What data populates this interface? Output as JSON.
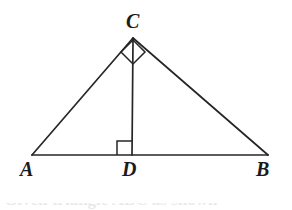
{
  "figure": {
    "background_color": "#ffffff",
    "stroke_color": "#262626",
    "label_color": "#1b1b1b",
    "stroke_width": 1.6,
    "width": 292,
    "height": 210
  },
  "labels": {
    "apex": "C",
    "left_base": "A",
    "foot": "D",
    "right_base": "B"
  },
  "points": {
    "A": {
      "x": 32,
      "y": 155
    },
    "B": {
      "x": 268,
      "y": 155
    },
    "C": {
      "x": 133,
      "y": 38
    },
    "D": {
      "x": 132,
      "y": 155
    }
  },
  "segments": [
    {
      "name": "base-AB",
      "from": "A",
      "to": "B"
    },
    {
      "name": "side-AC",
      "from": "A",
      "to": "C"
    },
    {
      "name": "side-CB",
      "from": "C",
      "to": "B"
    },
    {
      "name": "altitude-CD",
      "from": "C",
      "to": "D"
    }
  ],
  "right_angle_markers": [
    {
      "name": "right-angle-at-C",
      "at": "C",
      "style": "diamond",
      "size": 17,
      "points": "133,40 121,52 133,64 145,52"
    },
    {
      "name": "right-angle-at-D",
      "at": "D",
      "style": "square",
      "size": 14,
      "points": "132,141 117,141 117,155"
    }
  ],
  "caption": {
    "clipped_text": "Given triangle ABC as shown"
  }
}
